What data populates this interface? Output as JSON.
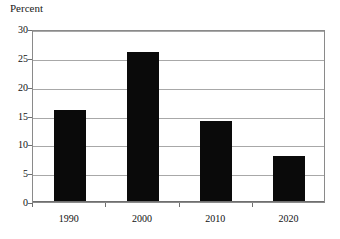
{
  "chart_data": {
    "type": "bar",
    "title": "",
    "subtitle": "",
    "xlabel": "",
    "ylabel": "Percent",
    "categories": [
      "1990",
      "2000",
      "2010",
      "2020"
    ],
    "values": [
      16,
      26,
      14,
      8
    ],
    "series": [
      {
        "name": "Percent",
        "values": [
          16,
          26,
          14,
          8
        ]
      }
    ],
    "ylim": [
      0,
      30
    ],
    "y_ticks": [
      0,
      5,
      10,
      15,
      20,
      25,
      30
    ],
    "y_tick_labels": [
      "0",
      "5",
      "10",
      "15",
      "20",
      "25",
      "30"
    ],
    "grid": true,
    "grid_axis": "y",
    "legend": false,
    "legend_position": "none",
    "annotations": [],
    "colors": {
      "bar": "#0a0a0a",
      "gridline": "#a8a8a8",
      "frame": "#8a8a8a",
      "axis": "#6f6f6f",
      "background": "#ffffff",
      "text": "#111111"
    }
  }
}
